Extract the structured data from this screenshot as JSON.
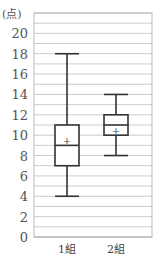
{
  "chart_data": {
    "type": "boxplot",
    "title": "",
    "ylabel": "(点)",
    "xlabel": "",
    "ylim": [
      0,
      22
    ],
    "yticks": [
      0,
      2,
      4,
      6,
      8,
      10,
      12,
      14,
      16,
      18,
      20
    ],
    "grid": true,
    "categories": [
      "1組",
      "2組"
    ],
    "series": [
      {
        "name": "1組",
        "min": 4,
        "q1": 7,
        "median": 9,
        "q3": 11,
        "max": 18,
        "mean": 9.5
      },
      {
        "name": "2組",
        "min": 8,
        "q1": 10,
        "median": 11,
        "q3": 12,
        "max": 14,
        "mean": 10.5
      }
    ]
  }
}
